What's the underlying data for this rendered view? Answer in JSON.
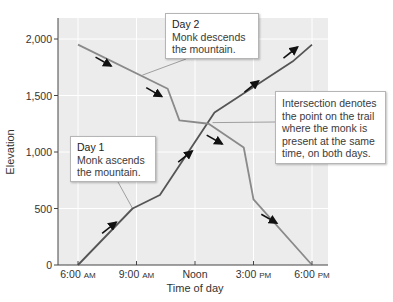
{
  "chart_data": {
    "type": "line",
    "title": "",
    "xlabel": "Time of day",
    "ylabel": "Elevation",
    "xlim": [
      6,
      18
    ],
    "ylim": [
      0,
      2300
    ],
    "grid": true,
    "x_ticks": [
      {
        "value": 6,
        "label": "6:00",
        "suffix": "AM"
      },
      {
        "value": 9,
        "label": "9:00",
        "suffix": "AM"
      },
      {
        "value": 12,
        "label": "Noon",
        "suffix": ""
      },
      {
        "value": 15,
        "label": "3:00",
        "suffix": "PM"
      },
      {
        "value": 18,
        "label": "6:00",
        "suffix": "PM"
      }
    ],
    "y_ticks": [
      {
        "value": 0,
        "label": "0"
      },
      {
        "value": 500,
        "label": "500"
      },
      {
        "value": 1000,
        "label": "1,000"
      },
      {
        "value": 1500,
        "label": "1,500"
      },
      {
        "value": 2000,
        "label": "2,000"
      }
    ],
    "series": [
      {
        "name": "Day 1",
        "color": "#555555",
        "x": [
          6.0,
          8.8,
          10.2,
          13.0,
          17.0,
          18.0
        ],
        "y": [
          0,
          500,
          620,
          1350,
          1800,
          1950
        ]
      },
      {
        "name": "Day 2",
        "color": "#8a8a8a",
        "x": [
          6.0,
          10.6,
          11.2,
          12.7,
          14.5,
          15.0,
          18.0
        ],
        "y": [
          1950,
          1560,
          1280,
          1250,
          1040,
          580,
          0
        ]
      }
    ],
    "direction_arrows": [
      {
        "series": "Day 1",
        "x": 7.6,
        "y": 330,
        "direction": "up"
      },
      {
        "series": "Day 1",
        "x": 11.5,
        "y": 960,
        "direction": "up"
      },
      {
        "series": "Day 1",
        "x": 14.9,
        "y": 1580,
        "direction": "up"
      },
      {
        "series": "Day 1",
        "x": 16.9,
        "y": 1880,
        "direction": "up"
      },
      {
        "series": "Day 2",
        "x": 7.3,
        "y": 1800,
        "direction": "down"
      },
      {
        "series": "Day 2",
        "x": 9.9,
        "y": 1530,
        "direction": "down"
      },
      {
        "series": "Day 2",
        "x": 13.0,
        "y": 1110,
        "direction": "down"
      },
      {
        "series": "Day 2",
        "x": 15.8,
        "y": 410,
        "direction": "down"
      }
    ],
    "annotations": [
      {
        "id": "day2",
        "title": "Day 2",
        "text": "Monk descends the mountain.",
        "points_to": {
          "x": 9.3,
          "y": 1680
        }
      },
      {
        "id": "day1",
        "title": "Day 1",
        "text": "Monk ascends the mountain.",
        "points_to": {
          "x": 8.8,
          "y": 500
        }
      },
      {
        "id": "intersection",
        "title": "",
        "text": "Intersection denotes the point on the trail where the monk is present at the same time, on both days.",
        "points_to": {
          "x": 12.9,
          "y": 1260
        }
      }
    ]
  },
  "callouts": {
    "day2": {
      "title": "Day 2",
      "line1": "Monk descends",
      "line2": "the mountain."
    },
    "day1": {
      "title": "Day 1",
      "line1": "Monk ascends",
      "line2": "the mountain."
    },
    "intersection": {
      "line1": "Intersection denotes",
      "line2": "the point on the trail",
      "line3": "where the monk is",
      "line4": "present at the same",
      "line5": "time, on both days."
    }
  }
}
